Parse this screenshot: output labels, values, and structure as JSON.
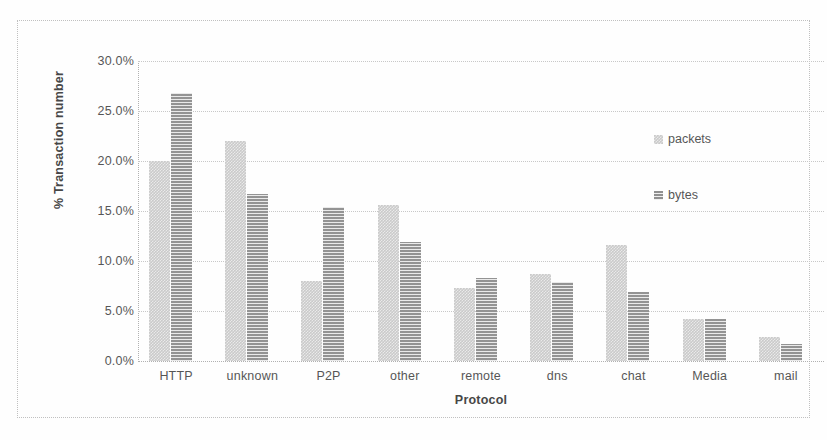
{
  "chart_data": {
    "type": "bar",
    "title": "",
    "xlabel": "Protocol",
    "ylabel": "% Transaction number",
    "ylim": [
      0,
      30
    ],
    "ytick_labels": [
      "0.0%",
      "5.0%",
      "10.0%",
      "15.0%",
      "20.0%",
      "25.0%",
      "30.0%"
    ],
    "ytick_values": [
      0,
      5,
      10,
      15,
      20,
      25,
      30
    ],
    "grid": true,
    "legend_position": "right",
    "categories": [
      "HTTP",
      "unknown",
      "P2P",
      "other",
      "remote",
      "dns",
      "chat",
      "Media",
      "mail"
    ],
    "series": [
      {
        "name": "packets",
        "color": "#c4c4c4",
        "values": [
          20.0,
          22.0,
          8.0,
          15.6,
          7.3,
          8.7,
          11.6,
          4.2,
          2.4
        ]
      },
      {
        "name": "bytes",
        "color": "#a9a9a9",
        "values": [
          26.8,
          16.7,
          15.4,
          11.9,
          8.3,
          7.9,
          6.9,
          4.2,
          1.7
        ]
      }
    ]
  },
  "legend": {
    "entries": [
      {
        "label": "packets",
        "swatch": "packets-swatch-icon"
      },
      {
        "label": "bytes",
        "swatch": "bytes-swatch-icon"
      }
    ]
  }
}
